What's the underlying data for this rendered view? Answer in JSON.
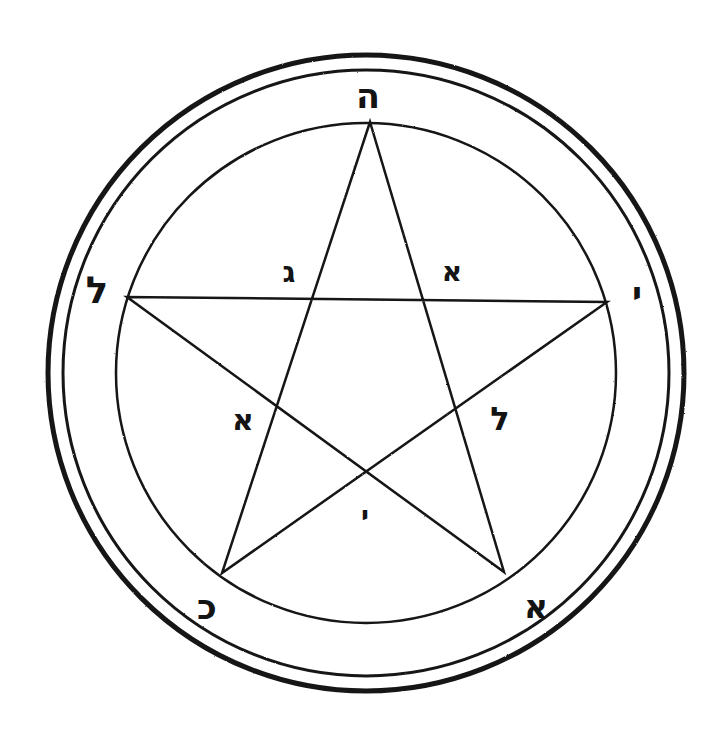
{
  "figure": {
    "background_color": "#ffffff",
    "ink_color": "#141414",
    "canvas": {
      "width": 726,
      "height": 733
    },
    "center": {
      "x": 366,
      "y": 373
    }
  },
  "circles": [
    {
      "name": "outer-ring-outer-edge",
      "radius": 318,
      "stroke_width": 5
    },
    {
      "name": "outer-ring-inner-edge",
      "radius": 303,
      "stroke_width": 3
    },
    {
      "name": "inner-circle",
      "radius": 250,
      "stroke_width": 2.5
    }
  ],
  "pentagram": {
    "stroke_width": 2.5,
    "vertices": [
      {
        "name": "apex-top",
        "x": 370,
        "y": 122
      },
      {
        "name": "vertex-right",
        "x": 607,
        "y": 302
      },
      {
        "name": "vertex-bottom-right",
        "x": 504,
        "y": 572
      },
      {
        "name": "vertex-bottom-left",
        "x": 222,
        "y": 573
      },
      {
        "name": "vertex-left",
        "x": 127,
        "y": 297
      }
    ],
    "path_order": [
      "apex-top",
      "vertex-bottom-right",
      "vertex-left",
      "vertex-right",
      "vertex-bottom-left",
      "apex-top"
    ]
  },
  "letters": {
    "outer": [
      {
        "id": "outer-top",
        "glyph": "ה",
        "name": "he",
        "x": 368,
        "y": 96,
        "class": "lt-he"
      },
      {
        "id": "outer-left",
        "glyph": "ל",
        "name": "lamed",
        "x": 97,
        "y": 290,
        "class": "lt-lamed-left"
      },
      {
        "id": "outer-right",
        "glyph": "י",
        "name": "yod",
        "x": 637,
        "y": 294,
        "class": "lt-yod-right"
      },
      {
        "id": "outer-bottom-left",
        "glyph": "כ",
        "name": "kaf",
        "x": 207,
        "y": 607,
        "class": "lt-kaf"
      },
      {
        "id": "outer-bottom-right",
        "glyph": "א",
        "name": "alef",
        "x": 536,
        "y": 606,
        "class": "lt-alef-br"
      }
    ],
    "inner": [
      {
        "id": "inner-upper-left",
        "glyph": "ג",
        "name": "gimel",
        "x": 289,
        "y": 272,
        "class": "lt-gimel"
      },
      {
        "id": "inner-upper-right",
        "glyph": "א",
        "name": "alef",
        "x": 452,
        "y": 272,
        "class": "lt-alef-ur"
      },
      {
        "id": "inner-mid-left",
        "glyph": "א",
        "name": "alef",
        "x": 243,
        "y": 420,
        "class": "lt-alef-ml"
      },
      {
        "id": "inner-mid-right",
        "glyph": "ל",
        "name": "lamed",
        "x": 500,
        "y": 419,
        "class": "lt-lamed-mr"
      },
      {
        "id": "inner-bottom-center",
        "glyph": "י",
        "name": "yod",
        "x": 365,
        "y": 515,
        "class": "lt-yod-bc"
      }
    ]
  }
}
